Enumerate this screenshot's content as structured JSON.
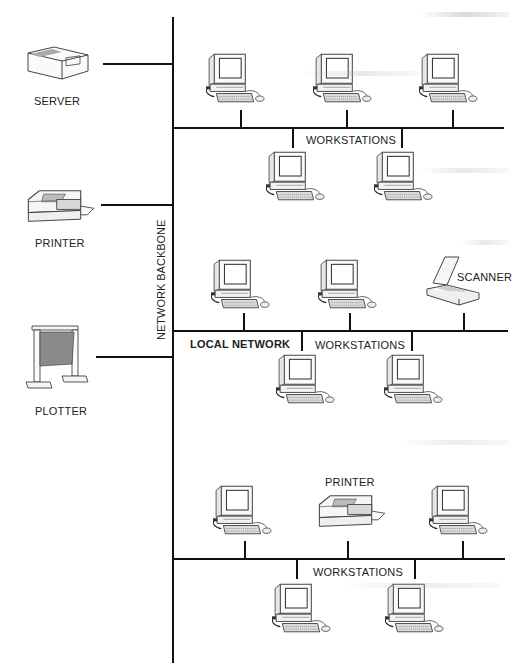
{
  "diagram": {
    "type": "network-topology",
    "backbone": {
      "label": "NETWORK BACKBONE"
    },
    "left_devices": [
      {
        "label": "SERVER",
        "icon": "server-icon"
      },
      {
        "label": "PRINTER",
        "icon": "printer-icon"
      },
      {
        "label": "PLOTTER",
        "icon": "plotter-icon"
      }
    ],
    "segments": [
      {
        "label": "WORKSTATIONS",
        "devices_above": [
          "workstation",
          "workstation",
          "workstation"
        ],
        "devices_below": [
          "workstation",
          "workstation"
        ]
      },
      {
        "label": "WORKSTATIONS",
        "network_label": "LOCAL NETWORK",
        "devices_above": [
          "workstation",
          "workstation",
          "scanner"
        ],
        "devices_below": [
          "workstation",
          "workstation"
        ],
        "scanner_label": "SCANNER"
      },
      {
        "label": "WORKSTATIONS",
        "devices_above": [
          "workstation",
          "printer",
          "workstation"
        ],
        "devices_below": [
          "workstation",
          "workstation"
        ],
        "printer_label": "PRINTER"
      }
    ]
  },
  "colors": {
    "line": "#111111",
    "background": "#ffffff"
  }
}
